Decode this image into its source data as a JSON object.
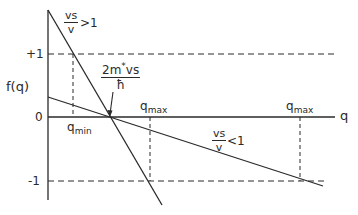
{
  "diagram": {
    "y_axis_label": "f(q)",
    "x_axis_label": "q",
    "y_ticks": [
      {
        "label": "+1",
        "value": 1
      },
      {
        "label": "0",
        "value": 0
      },
      {
        "label": "-1",
        "value": -1
      }
    ],
    "lines": [
      {
        "name": "steep-line",
        "condition": {
          "numerator": "vs",
          "denominator": "v",
          "relation": ">1"
        },
        "q_min_label": "q",
        "q_min_sub": "min",
        "q_max_label": "q",
        "q_max_sub": "max"
      },
      {
        "name": "shallow-line",
        "condition": {
          "numerator": "vs",
          "denominator": "v",
          "relation": "<1"
        },
        "q_max_label": "q",
        "q_max_sub": "max"
      }
    ],
    "intercept_annotation": {
      "numerator": "2m",
      "numerator_sup": "*",
      "numerator_tail": "vs",
      "denominator": "ħ"
    },
    "colors": {
      "ink": "#2a2a2a",
      "background": "#ffffff"
    }
  }
}
